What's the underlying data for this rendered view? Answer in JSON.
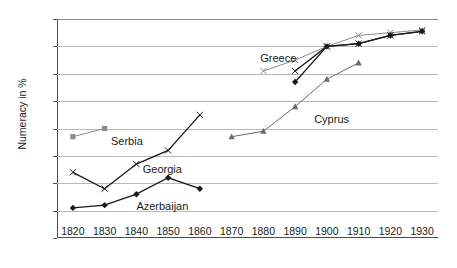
{
  "chart_data": {
    "type": "line",
    "title": "",
    "xlabel": "",
    "ylabel": "Numeracy in %",
    "xlim": [
      1815,
      1935
    ],
    "ylim": [
      20,
      100
    ],
    "xticks": [
      1820,
      1830,
      1840,
      1850,
      1860,
      1870,
      1880,
      1890,
      1900,
      1910,
      1920,
      1930
    ],
    "yticks": [
      20,
      30,
      40,
      50,
      60,
      70,
      80,
      90,
      100
    ],
    "grid": true,
    "legend_position": "inline-annotations",
    "series": [
      {
        "name": "Serbia",
        "color": "#8c8c8c",
        "marker": "square",
        "x": [
          1820,
          1830
        ],
        "values": [
          57,
          60
        ]
      },
      {
        "name": "Georgia",
        "color": "#1a1a1a",
        "marker": "x",
        "x": [
          1820,
          1830,
          1840,
          1850,
          1860
        ],
        "values": [
          44,
          38,
          47,
          52,
          65
        ]
      },
      {
        "name": "Azerbaijan",
        "color": "#1a1a1a",
        "marker": "diamond",
        "x": [
          1820,
          1830,
          1840,
          1850,
          1860
        ],
        "values": [
          31,
          32,
          36,
          42,
          38
        ]
      },
      {
        "name": "Cyprus",
        "color": "#6b6b6b",
        "marker": "triangle",
        "x": [
          1870,
          1880,
          1890,
          1900,
          1910
        ],
        "values": [
          57,
          59,
          68,
          78,
          84
        ]
      },
      {
        "name": "Greece",
        "color": "#8c8c8c",
        "marker": "x",
        "x": [
          1880,
          1890,
          1900,
          1910,
          1920,
          1930
        ],
        "values": [
          81,
          85,
          90,
          94,
          95,
          96
        ]
      },
      {
        "name": "Georgia late",
        "color": "#1a1a1a",
        "marker": "x",
        "x": [
          1890,
          1900,
          1910,
          1920,
          1930
        ],
        "values": [
          81,
          90,
          91,
          94,
          95.5
        ]
      },
      {
        "name": "Azerbaijan late",
        "color": "#1a1a1a",
        "marker": "diamond",
        "x": [
          1890,
          1900,
          1910,
          1920,
          1930
        ],
        "values": [
          77,
          90,
          91,
          94,
          95.5
        ]
      }
    ],
    "annotations": [
      {
        "text": "Serbia",
        "x": 1832,
        "y": 55.0
      },
      {
        "text": "Georgia",
        "x": 1842,
        "y": 45.0
      },
      {
        "text": "Azerbaijan",
        "x": 1840,
        "y": 31.5
      },
      {
        "text": "Cyprus",
        "x": 1896,
        "y": 63.0
      },
      {
        "text": "Greece",
        "x": 1879,
        "y": 85.5
      }
    ]
  }
}
